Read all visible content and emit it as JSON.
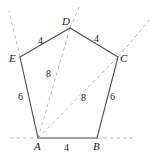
{
  "figure": {
    "type": "geometry-diagram",
    "shape": "pentagon",
    "stroke_color": "#4a4a4a",
    "dash_color": "#b9b9b9",
    "text_color": "#1a1a1a",
    "background": "#ffffff",
    "width": 155,
    "height": 158
  },
  "vertices": [
    {
      "name": "A",
      "label": "A",
      "x": 38,
      "y": 138,
      "label_x": 34,
      "label_y": 141
    },
    {
      "name": "B",
      "label": "B",
      "x": 97,
      "y": 138,
      "label_x": 93,
      "label_y": 141
    },
    {
      "name": "C",
      "label": "C",
      "x": 118,
      "y": 57,
      "label_x": 120,
      "label_y": 53
    },
    {
      "name": "D",
      "label": "D",
      "x": 70,
      "y": 28,
      "label_x": 62,
      "label_y": 16
    },
    {
      "name": "E",
      "label": "E",
      "x": 20,
      "y": 57,
      "label_x": 9,
      "label_y": 53
    }
  ],
  "edges": [
    {
      "name": "AB",
      "from": "A",
      "to": "B",
      "label": "4",
      "label_x": 64,
      "label_y": 143
    },
    {
      "name": "BC",
      "from": "B",
      "to": "C",
      "label": "6",
      "label_x": 110,
      "label_y": 92
    },
    {
      "name": "CD",
      "from": "C",
      "to": "D",
      "label": "4",
      "label_x": 94,
      "label_y": 34
    },
    {
      "name": "DE",
      "from": "D",
      "to": "E",
      "label": "4",
      "label_x": 38,
      "label_y": 36
    },
    {
      "name": "EA",
      "from": "E",
      "to": "A",
      "label": "6",
      "label_x": 18,
      "label_y": 92
    }
  ],
  "diagonals": [
    {
      "name": "AD",
      "from": "A",
      "to": "D",
      "label": "8",
      "label_x": 46,
      "label_y": 69
    },
    {
      "name": "AC",
      "from": "A",
      "to": "C",
      "label": "8",
      "label_x": 81,
      "label_y": 93
    }
  ],
  "extension_lines": [
    {
      "name": "extension-through-A-left",
      "x1": 10,
      "y1": 138,
      "x2": 38,
      "y2": 138
    },
    {
      "name": "extension-through-B-right",
      "x1": 97,
      "y1": 138,
      "x2": 132,
      "y2": 138
    },
    {
      "name": "extension-through-E-up",
      "x1": 20,
      "y1": 57,
      "x2": 9,
      "y2": 11
    },
    {
      "name": "extension-through-D-up",
      "x1": 70,
      "y1": 28,
      "x2": 80,
      "y2": 5
    },
    {
      "name": "extension-through-C-up",
      "x1": 118,
      "y1": 57,
      "x2": 152,
      "y2": 17
    }
  ]
}
